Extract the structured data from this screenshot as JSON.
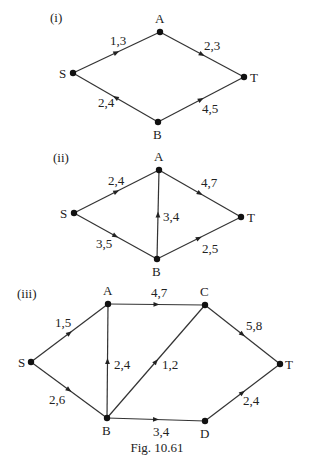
{
  "caption": "Fig. 10.61",
  "networks": [
    {
      "label": "(i)",
      "label_pos": [
        50,
        22
      ],
      "nodes": [
        {
          "id": "S",
          "x": 73,
          "y": 73,
          "lx": -14,
          "ly": 5
        },
        {
          "id": "A",
          "x": 160,
          "y": 32,
          "lx": -5,
          "ly": -9
        },
        {
          "id": "T",
          "x": 244,
          "y": 77,
          "lx": 6,
          "ly": 5
        },
        {
          "id": "B",
          "x": 158,
          "y": 122,
          "lx": -5,
          "ly": 17
        }
      ],
      "edges": [
        {
          "from": "S",
          "to": "A",
          "label": "1,3",
          "lpx": 110,
          "lpy": 45
        },
        {
          "from": "A",
          "to": "T",
          "label": "2,3",
          "lpx": 204,
          "lpy": 50
        },
        {
          "from": "B",
          "to": "S",
          "label": "2,4",
          "lpx": 98,
          "lpy": 107
        },
        {
          "from": "B",
          "to": "T",
          "label": "4,5",
          "lpx": 202,
          "lpy": 113
        }
      ]
    },
    {
      "label": "(ii)",
      "label_pos": [
        53,
        162
      ],
      "nodes": [
        {
          "id": "S",
          "x": 74,
          "y": 213,
          "lx": -14,
          "ly": 5
        },
        {
          "id": "A",
          "x": 159,
          "y": 170,
          "lx": -5,
          "ly": -9
        },
        {
          "id": "T",
          "x": 241,
          "y": 217,
          "lx": 6,
          "ly": 5
        },
        {
          "id": "B",
          "x": 157,
          "y": 259,
          "lx": -5,
          "ly": 17
        }
      ],
      "edges": [
        {
          "from": "S",
          "to": "A",
          "label": "2,4",
          "lpx": 108,
          "lpy": 185
        },
        {
          "from": "A",
          "to": "T",
          "label": "4,7",
          "lpx": 201,
          "lpy": 187
        },
        {
          "from": "S",
          "to": "B",
          "label": "3,5",
          "lpx": 96,
          "lpy": 248
        },
        {
          "from": "B",
          "to": "A",
          "label": "3,4",
          "lpx": 163,
          "lpy": 221
        },
        {
          "from": "B",
          "to": "T",
          "label": "2,5",
          "lpx": 202,
          "lpy": 253
        }
      ]
    },
    {
      "label": "(iii)",
      "label_pos": [
        17,
        298
      ],
      "nodes": [
        {
          "id": "S",
          "x": 31,
          "y": 362,
          "lx": -13,
          "ly": 5
        },
        {
          "id": "A",
          "x": 108,
          "y": 304,
          "lx": -5,
          "ly": -9
        },
        {
          "id": "C",
          "x": 205,
          "y": 305,
          "lx": -5,
          "ly": -9
        },
        {
          "id": "T",
          "x": 280,
          "y": 364,
          "lx": 5,
          "ly": 5
        },
        {
          "id": "B",
          "x": 107,
          "y": 418,
          "lx": -5,
          "ly": 17
        },
        {
          "id": "D",
          "x": 205,
          "y": 421,
          "lx": -5,
          "ly": 17
        }
      ],
      "edges": [
        {
          "from": "S",
          "to": "A",
          "label": "1,5",
          "lpx": 55,
          "lpy": 327
        },
        {
          "from": "A",
          "to": "C",
          "label": "4,7",
          "lpx": 151,
          "lpy": 297
        },
        {
          "from": "C",
          "to": "T",
          "label": "5,8",
          "lpx": 246,
          "lpy": 330
        },
        {
          "from": "S",
          "to": "B",
          "label": "2,6",
          "lpx": 49,
          "lpy": 404
        },
        {
          "from": "B",
          "to": "A",
          "label": "2,4",
          "lpx": 114,
          "lpy": 369
        },
        {
          "from": "B",
          "to": "C",
          "label": "1,2",
          "lpx": 162,
          "lpy": 369
        },
        {
          "from": "B",
          "to": "D",
          "label": "3,4",
          "lpx": 153,
          "lpy": 436
        },
        {
          "from": "D",
          "to": "T",
          "label": "2,4",
          "lpx": 243,
          "lpy": 405
        }
      ]
    }
  ]
}
